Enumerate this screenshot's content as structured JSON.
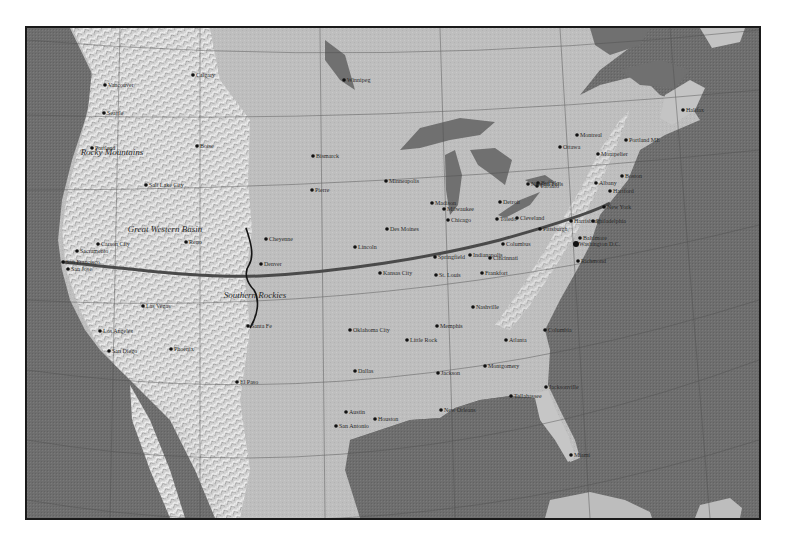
{
  "map": {
    "title": "North America shaded relief map",
    "colors": {
      "ocean": "#6e6e6e",
      "land": "#bdbdbd",
      "mountains": "#d8d8d8",
      "lakes": "#707070",
      "route": "#4a4a4a",
      "boundary": "#1a1a1a",
      "graticule": "#555555",
      "city_dot": "#111111"
    },
    "regions": [
      {
        "label": "Great Western Basin",
        "x": 165,
        "y": 232
      },
      {
        "label": "Rocky Mountains",
        "x": 112,
        "y": 155
      },
      {
        "label": "Southern Rockies",
        "x": 255,
        "y": 298
      }
    ],
    "route": {
      "label": "San Francisco to New York route",
      "from": "San Francisco",
      "to": "New York"
    },
    "cities": [
      {
        "name": "Calgary",
        "x": 193,
        "y": 75
      },
      {
        "name": "Vancouver",
        "x": 105,
        "y": 85
      },
      {
        "name": "Seattle",
        "x": 104,
        "y": 113
      },
      {
        "name": "Portland",
        "x": 92,
        "y": 148
      },
      {
        "name": "Boise",
        "x": 197,
        "y": 146
      },
      {
        "name": "Salt Lake City",
        "x": 146,
        "y": 185
      },
      {
        "name": "Bismarck",
        "x": 313,
        "y": 156
      },
      {
        "name": "Pierre",
        "x": 312,
        "y": 190
      },
      {
        "name": "Winnipeg",
        "x": 344,
        "y": 80
      },
      {
        "name": "Minneapolis",
        "x": 386,
        "y": 181
      },
      {
        "name": "Sacramento",
        "x": 77,
        "y": 251
      },
      {
        "name": "Carson City",
        "x": 98,
        "y": 244
      },
      {
        "name": "Reno",
        "x": 186,
        "y": 242
      },
      {
        "name": "San Francisco",
        "x": 63,
        "y": 262
      },
      {
        "name": "San Jose",
        "x": 68,
        "y": 269
      },
      {
        "name": "Las Vegas",
        "x": 143,
        "y": 306
      },
      {
        "name": "Los Angeles",
        "x": 100,
        "y": 331
      },
      {
        "name": "San Diego",
        "x": 109,
        "y": 351
      },
      {
        "name": "Phoenix",
        "x": 171,
        "y": 349
      },
      {
        "name": "Cheyenne",
        "x": 266,
        "y": 239
      },
      {
        "name": "Denver",
        "x": 261,
        "y": 264
      },
      {
        "name": "Santa Fe",
        "x": 248,
        "y": 326
      },
      {
        "name": "El Paso",
        "x": 237,
        "y": 382
      },
      {
        "name": "Lincoln",
        "x": 355,
        "y": 247
      },
      {
        "name": "Des Moines",
        "x": 387,
        "y": 229
      },
      {
        "name": "Kansas City",
        "x": 380,
        "y": 273
      },
      {
        "name": "Oklahoma City",
        "x": 350,
        "y": 330
      },
      {
        "name": "Dallas",
        "x": 355,
        "y": 371
      },
      {
        "name": "San Antonio",
        "x": 336,
        "y": 426
      },
      {
        "name": "Austin",
        "x": 346,
        "y": 412
      },
      {
        "name": "Houston",
        "x": 375,
        "y": 419
      },
      {
        "name": "New Orleans",
        "x": 441,
        "y": 410
      },
      {
        "name": "Little Rock",
        "x": 407,
        "y": 340
      },
      {
        "name": "Memphis",
        "x": 437,
        "y": 326
      },
      {
        "name": "Jackson",
        "x": 438,
        "y": 373
      },
      {
        "name": "Montgomery",
        "x": 485,
        "y": 366
      },
      {
        "name": "St. Louis",
        "x": 436,
        "y": 275
      },
      {
        "name": "Springfield",
        "x": 435,
        "y": 257
      },
      {
        "name": "Chicago",
        "x": 448,
        "y": 220
      },
      {
        "name": "Milwaukee",
        "x": 444,
        "y": 209
      },
      {
        "name": "Madison",
        "x": 432,
        "y": 203
      },
      {
        "name": "Detroit",
        "x": 500,
        "y": 202
      },
      {
        "name": "Toledo",
        "x": 497,
        "y": 219
      },
      {
        "name": "Cleveland",
        "x": 517,
        "y": 218
      },
      {
        "name": "Indianapolis",
        "x": 470,
        "y": 255
      },
      {
        "name": "Cincinnati",
        "x": 490,
        "y": 258
      },
      {
        "name": "Frankfort",
        "x": 482,
        "y": 273
      },
      {
        "name": "Columbus",
        "x": 503,
        "y": 244
      },
      {
        "name": "Nashville",
        "x": 473,
        "y": 307
      },
      {
        "name": "Atlanta",
        "x": 506,
        "y": 340
      },
      {
        "name": "Columbia",
        "x": 545,
        "y": 330
      },
      {
        "name": "Tallahassee",
        "x": 511,
        "y": 396
      },
      {
        "name": "Jacksonville",
        "x": 546,
        "y": 387
      },
      {
        "name": "Miami",
        "x": 571,
        "y": 455
      },
      {
        "name": "Toronto",
        "x": 537,
        "y": 186
      },
      {
        "name": "Buffalo",
        "x": 538,
        "y": 183
      },
      {
        "name": "Niagara Falls",
        "x": 528,
        "y": 184
      },
      {
        "name": "Pittsburgh",
        "x": 540,
        "y": 229
      },
      {
        "name": "Harrisburg",
        "x": 571,
        "y": 221
      },
      {
        "name": "Baltimore",
        "x": 580,
        "y": 238
      },
      {
        "name": "Washington D.C.",
        "x": 576,
        "y": 244
      },
      {
        "name": "Richmond",
        "x": 578,
        "y": 261
      },
      {
        "name": "Philadelphia",
        "x": 593,
        "y": 221
      },
      {
        "name": "New York",
        "x": 604,
        "y": 207
      },
      {
        "name": "Albany",
        "x": 596,
        "y": 183
      },
      {
        "name": "Hartford",
        "x": 610,
        "y": 191
      },
      {
        "name": "Boston",
        "x": 622,
        "y": 176
      },
      {
        "name": "Montpelier",
        "x": 598,
        "y": 154
      },
      {
        "name": "Ottawa",
        "x": 560,
        "y": 147
      },
      {
        "name": "Montreal",
        "x": 577,
        "y": 135
      },
      {
        "name": "Portland ME",
        "x": 626,
        "y": 140
      },
      {
        "name": "Halifax",
        "x": 683,
        "y": 110
      }
    ]
  }
}
